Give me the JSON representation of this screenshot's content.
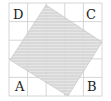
{
  "diagram": {
    "grid": {
      "cols": 5,
      "rows": 5,
      "x0": 9,
      "y0": 3,
      "cell": 18.6,
      "line_color": "#c8c8c8"
    },
    "square": {
      "points": [
        [
          46,
          5
        ],
        [
          102,
          42
        ],
        [
          68,
          96
        ],
        [
          10,
          60
        ]
      ],
      "fill": "#d8d8d8",
      "hatch_color": "#a8a8a8"
    },
    "labels": {
      "A": "A",
      "B": "B",
      "C": "C",
      "D": "D"
    }
  }
}
